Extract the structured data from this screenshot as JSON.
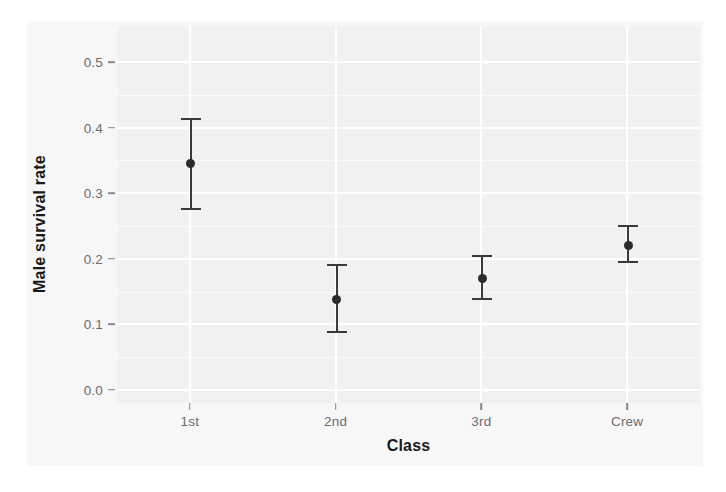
{
  "chart_data": {
    "type": "scatter",
    "title": "",
    "subtitle": "",
    "xlabel": "Class",
    "ylabel": "Male survival rate",
    "categories": [
      "1st",
      "2nd",
      "3rd",
      "Crew"
    ],
    "values": [
      0.345,
      0.138,
      0.17,
      0.22
    ],
    "error_low": [
      0.274,
      0.086,
      0.137,
      0.193
    ],
    "error_high": [
      0.414,
      0.192,
      0.205,
      0.251
    ],
    "series": [
      {
        "name": "Male survival rate",
        "points": [
          {
            "category": "1st",
            "value": 0.345,
            "low": 0.274,
            "high": 0.414
          },
          {
            "category": "2nd",
            "value": 0.138,
            "low": 0.086,
            "high": 0.192
          },
          {
            "category": "3rd",
            "value": 0.17,
            "low": 0.137,
            "high": 0.205
          },
          {
            "category": "Crew",
            "value": 0.22,
            "low": 0.193,
            "high": 0.251
          }
        ]
      }
    ],
    "ylim": [
      -0.02,
      0.555
    ],
    "yticks": [
      0.0,
      0.1,
      0.2,
      0.3,
      0.4,
      0.5
    ],
    "ytick_labels": [
      "0.0",
      "0.1",
      "0.2",
      "0.3",
      "0.4",
      "0.5"
    ],
    "grid": true,
    "grid_minor": true,
    "legend": "none",
    "point_color": "#2b2b2b",
    "errorbar_color": "#3a3a3a",
    "panel_color": "#f1f1f1",
    "gridline_color": "#ffffff"
  },
  "axes": {
    "y_title": "Male survival rate",
    "x_title": "Class"
  }
}
